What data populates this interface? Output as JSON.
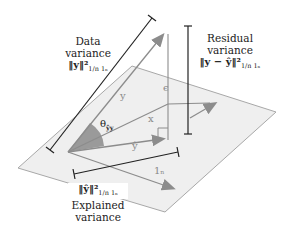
{
  "diagram": {
    "type": "geometric-vector-projection",
    "labels": {
      "data_variance": {
        "line1": "Data",
        "line2": "variance",
        "formula": "‖y‖²",
        "sub": "1/n 1ₙ"
      },
      "residual_variance": {
        "line1": "Residual",
        "line2": "variance",
        "formula": "‖y − ŷ‖²",
        "sub": "1/n 1ₙ"
      },
      "explained_variance": {
        "line1": "Explained",
        "line2": "variance",
        "formula": "‖ŷ‖²",
        "sub": "1/n 1ₙ"
      }
    },
    "vectors": {
      "y": "y",
      "x": "x",
      "y_hat": "ŷ",
      "ones": "1ₙ",
      "epsilon": "ϵ"
    },
    "angle": {
      "label": "θ",
      "sub": "ŷy"
    },
    "colors": {
      "plane_fill": "#efefef",
      "plane_edge": "#9a9a9a",
      "vector": "#8c8c8c",
      "bracket": "#222222",
      "angle_fill": "#9a9a9a"
    }
  }
}
